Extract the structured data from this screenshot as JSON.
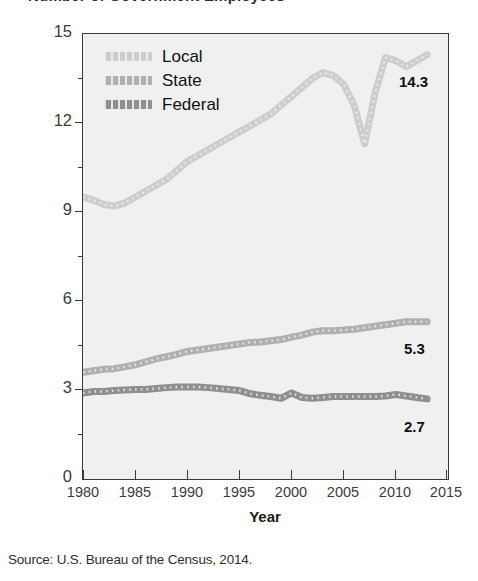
{
  "figure": {
    "clipped_title": "Number of Government Employees",
    "source_note": "Source: U.S. Bureau of the Census, 2014."
  },
  "legend": {
    "position": "top-left-inside",
    "items": [
      {
        "label": "Local",
        "color": "#cdcdcd"
      },
      {
        "label": "State",
        "color": "#b0b0b0"
      },
      {
        "label": "Federal",
        "color": "#8f8f8f"
      }
    ]
  },
  "end_labels": [
    {
      "series": "Local",
      "value": "14.3"
    },
    {
      "series": "State",
      "value": "5.3"
    },
    {
      "series": "Federal",
      "value": "2.7"
    }
  ],
  "chart_data": {
    "type": "line",
    "title": "Number of Government Employees",
    "xlabel": "Year",
    "ylabel": "Number of Employees (in millions)",
    "xlim": [
      1980,
      2015
    ],
    "ylim": [
      0,
      15
    ],
    "yticks": [
      0,
      3,
      6,
      9,
      12,
      15
    ],
    "yticks_minor": [
      1.5,
      4.5,
      7.5,
      10.5,
      13.5
    ],
    "xticks": [
      1980,
      1985,
      1990,
      1995,
      2000,
      2005,
      2010,
      2015
    ],
    "grid": false,
    "legend_position": "upper left",
    "x": [
      1980,
      1981,
      1982,
      1983,
      1984,
      1985,
      1986,
      1987,
      1988,
      1989,
      1990,
      1991,
      1992,
      1993,
      1994,
      1995,
      1996,
      1997,
      1998,
      1999,
      2000,
      2001,
      2002,
      2003,
      2004,
      2005,
      2006,
      2007,
      2008,
      2009,
      2010,
      2011,
      2012,
      2013
    ],
    "series": [
      {
        "name": "Local",
        "color": "#cdcdcd",
        "values": [
          9.5,
          9.4,
          9.25,
          9.2,
          9.3,
          9.5,
          9.7,
          9.9,
          10.1,
          10.4,
          10.7,
          10.9,
          11.1,
          11.3,
          11.5,
          11.7,
          11.9,
          12.1,
          12.3,
          12.6,
          12.9,
          13.2,
          13.5,
          13.7,
          13.6,
          13.3,
          12.6,
          11.3,
          13.0,
          14.2,
          14.1,
          13.9,
          14.1,
          14.3
        ],
        "end_value": 14.3
      },
      {
        "name": "State",
        "color": "#b0b0b0",
        "values": [
          3.6,
          3.65,
          3.7,
          3.72,
          3.78,
          3.85,
          3.95,
          4.05,
          4.12,
          4.2,
          4.3,
          4.35,
          4.4,
          4.45,
          4.5,
          4.55,
          4.6,
          4.62,
          4.66,
          4.7,
          4.78,
          4.85,
          4.95,
          5.0,
          5.0,
          5.02,
          5.05,
          5.1,
          5.15,
          5.2,
          5.25,
          5.3,
          5.3,
          5.3
        ],
        "end_value": 5.3
      },
      {
        "name": "Federal",
        "color": "#8f8f8f",
        "values": [
          2.9,
          2.95,
          2.95,
          2.98,
          3.0,
          3.02,
          3.02,
          3.05,
          3.08,
          3.1,
          3.1,
          3.1,
          3.08,
          3.05,
          3.02,
          2.98,
          2.88,
          2.82,
          2.78,
          2.72,
          2.9,
          2.75,
          2.72,
          2.75,
          2.78,
          2.78,
          2.78,
          2.78,
          2.78,
          2.8,
          2.85,
          2.8,
          2.75,
          2.7
        ],
        "end_value": 2.7
      }
    ]
  },
  "axes": {
    "y_labels": [
      "15",
      "12",
      "9",
      "6",
      "3",
      "0"
    ],
    "x_labels": [
      "1980",
      "1985",
      "1990",
      "1995",
      "2000",
      "2005",
      "2010",
      "2015"
    ]
  }
}
